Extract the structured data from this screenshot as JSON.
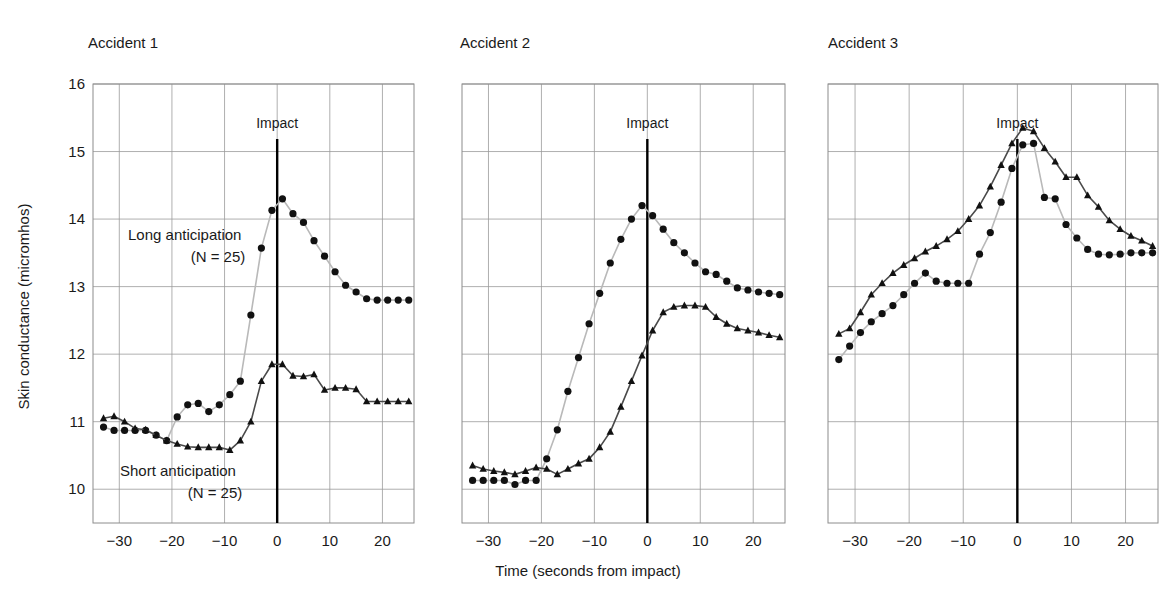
{
  "figure": {
    "xlabel": "Time (seconds from impact)",
    "ylabel": "Skin conductance (micromhos)",
    "impact_label": "Impact",
    "series_labels": {
      "long": "Long anticipation",
      "long_n": "(N = 25)",
      "short": "Short anticipation",
      "short_n": "(N = 25)"
    }
  },
  "axes": {
    "yticks": [
      "16",
      "15",
      "14",
      "13",
      "12",
      "11",
      "10"
    ],
    "xticks": [
      "−30",
      "−20",
      "−10",
      "0",
      "10",
      "20"
    ],
    "ylim": [
      9.5,
      16.0
    ],
    "xlim": [
      -35,
      26
    ]
  },
  "panels": [
    {
      "title": "Accident 1"
    },
    {
      "title": "Accident 2"
    },
    {
      "title": "Accident 3"
    }
  ],
  "chart_data": {
    "type": "line",
    "xlabel": "Time (seconds from impact)",
    "ylabel": "Skin conductance (micromhos)",
    "xlim": [
      -35,
      26
    ],
    "ylim": [
      9.5,
      16.0
    ],
    "xticks": [
      -30,
      -20,
      -10,
      0,
      10,
      20
    ],
    "yticks": [
      10,
      11,
      12,
      13,
      14,
      15,
      16
    ],
    "grid": true,
    "legend": "inline annotations",
    "annotations": [
      {
        "text": "Impact",
        "x": 0,
        "note": "vertical line at t = 0 in every panel"
      },
      {
        "text": "Long anticipation (N = 25)",
        "marker": "filled-circle"
      },
      {
        "text": "Short anticipation (N = 25)",
        "marker": "filled-triangle"
      }
    ],
    "panels": [
      {
        "name": "Accident 1",
        "series": [
          {
            "name": "Long anticipation (N = 25)",
            "marker": "circle",
            "x": [
              -33,
              -31,
              -29,
              -27,
              -25,
              -23,
              -21,
              -19,
              -17,
              -15,
              -13,
              -11,
              -9,
              -7,
              -5,
              -3,
              -1,
              1,
              3,
              5,
              7,
              9,
              11,
              13,
              15,
              17,
              19,
              21,
              23,
              25
            ],
            "y": [
              10.92,
              10.87,
              10.87,
              10.87,
              10.87,
              10.8,
              10.72,
              11.07,
              11.25,
              11.27,
              11.15,
              11.25,
              11.4,
              11.6,
              12.58,
              13.57,
              14.13,
              14.3,
              14.08,
              13.95,
              13.68,
              13.45,
              13.22,
              13.02,
              12.92,
              12.82,
              12.8,
              12.8,
              12.8,
              12.8
            ]
          },
          {
            "name": "Short anticipation (N = 25)",
            "marker": "triangle",
            "x": [
              -33,
              -31,
              -29,
              -27,
              -25,
              -23,
              -21,
              -19,
              -17,
              -15,
              -13,
              -11,
              -9,
              -7,
              -5,
              -3,
              -1,
              1,
              3,
              5,
              7,
              9,
              11,
              13,
              15,
              17,
              19,
              21,
              23,
              25
            ],
            "y": [
              11.05,
              11.08,
              11.0,
              10.9,
              10.88,
              10.8,
              10.72,
              10.67,
              10.63,
              10.62,
              10.62,
              10.62,
              10.58,
              10.72,
              11.0,
              11.6,
              11.85,
              11.85,
              11.68,
              11.67,
              11.7,
              11.47,
              11.5,
              11.5,
              11.48,
              11.3,
              11.3,
              11.3,
              11.3,
              11.3
            ]
          }
        ]
      },
      {
        "name": "Accident 2",
        "series": [
          {
            "name": "Long anticipation (N = 25)",
            "marker": "circle",
            "x": [
              -33,
              -31,
              -29,
              -27,
              -25,
              -23,
              -21,
              -19,
              -17,
              -15,
              -13,
              -11,
              -9,
              -7,
              -5,
              -3,
              -1,
              1,
              3,
              5,
              7,
              9,
              11,
              13,
              15,
              17,
              19,
              21,
              23,
              25
            ],
            "y": [
              10.13,
              10.13,
              10.13,
              10.13,
              10.07,
              10.13,
              10.13,
              10.45,
              10.88,
              11.45,
              11.95,
              12.45,
              12.9,
              13.35,
              13.7,
              14.0,
              14.2,
              14.05,
              13.85,
              13.65,
              13.5,
              13.35,
              13.22,
              13.18,
              13.08,
              12.98,
              12.95,
              12.92,
              12.9,
              12.88
            ]
          },
          {
            "name": "Short anticipation (N = 25)",
            "marker": "triangle",
            "x": [
              -33,
              -31,
              -29,
              -27,
              -25,
              -23,
              -21,
              -19,
              -17,
              -15,
              -13,
              -11,
              -9,
              -7,
              -5,
              -3,
              -1,
              1,
              3,
              5,
              7,
              9,
              11,
              13,
              15,
              17,
              19,
              21,
              23,
              25
            ],
            "y": [
              10.35,
              10.3,
              10.27,
              10.25,
              10.22,
              10.27,
              10.32,
              10.3,
              10.22,
              10.3,
              10.38,
              10.45,
              10.62,
              10.85,
              11.22,
              11.6,
              11.98,
              12.35,
              12.62,
              12.7,
              12.72,
              12.72,
              12.7,
              12.55,
              12.45,
              12.38,
              12.35,
              12.32,
              12.28,
              12.25
            ]
          }
        ]
      },
      {
        "name": "Accident 3",
        "series": [
          {
            "name": "Long anticipation (N = 25)",
            "marker": "circle",
            "x": [
              -33,
              -31,
              -29,
              -27,
              -25,
              -23,
              -21,
              -19,
              -17,
              -15,
              -13,
              -11,
              -9,
              -7,
              -5,
              -3,
              -1,
              1,
              3,
              5,
              7,
              9,
              11,
              13,
              15,
              17,
              19,
              21,
              23,
              25
            ],
            "y": [
              11.92,
              12.12,
              12.32,
              12.48,
              12.6,
              12.72,
              12.88,
              13.05,
              13.2,
              13.08,
              13.05,
              13.05,
              13.05,
              13.48,
              13.8,
              14.25,
              14.75,
              15.1,
              15.12,
              14.32,
              14.3,
              13.92,
              13.72,
              13.55,
              13.48,
              13.47,
              13.48,
              13.5,
              13.5,
              13.5
            ]
          },
          {
            "name": "Short anticipation (N = 25)",
            "marker": "triangle",
            "x": [
              -33,
              -31,
              -29,
              -27,
              -25,
              -23,
              -21,
              -19,
              -17,
              -15,
              -13,
              -11,
              -9,
              -7,
              -5,
              -3,
              -1,
              1,
              3,
              5,
              7,
              9,
              11,
              13,
              15,
              17,
              19,
              21,
              23,
              25
            ],
            "y": [
              12.3,
              12.38,
              12.62,
              12.88,
              13.05,
              13.2,
              13.32,
              13.42,
              13.52,
              13.6,
              13.7,
              13.82,
              14.0,
              14.2,
              14.48,
              14.8,
              15.12,
              15.35,
              15.3,
              15.05,
              14.85,
              14.62,
              14.62,
              14.35,
              14.18,
              13.98,
              13.85,
              13.75,
              13.68,
              13.6
            ]
          }
        ]
      }
    ]
  }
}
